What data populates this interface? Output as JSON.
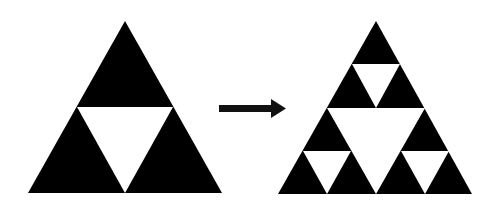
{
  "diagram": {
    "fill_color": "#000000",
    "background_color": "#ffffff",
    "stages": [
      {
        "name": "iteration-1",
        "apex": [
          125,
          21
        ],
        "base_left": [
          28,
          193
        ],
        "base_right": [
          222,
          193
        ],
        "holes": 1
      },
      {
        "name": "iteration-2",
        "apex": [
          376,
          21
        ],
        "base_left": [
          278,
          194
        ],
        "base_right": [
          472,
          194
        ],
        "holes": 4
      }
    ],
    "arrow": {
      "from": [
        219,
        108
      ],
      "to": [
        286,
        108
      ],
      "direction": "right"
    }
  }
}
